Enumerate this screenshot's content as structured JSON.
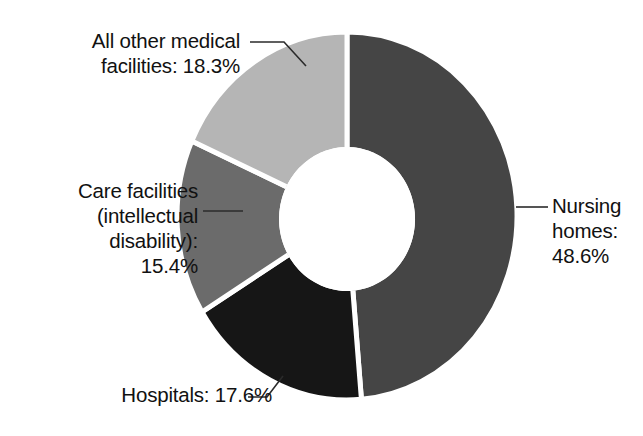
{
  "chart_data": {
    "type": "pie",
    "variant": "donut",
    "title": "",
    "subtitle": "",
    "xlabel": "",
    "ylabel": "",
    "legend_position": "none",
    "grid": false,
    "units": "percent",
    "total": 99.9,
    "start_angle_deg": 0,
    "direction": "clockwise",
    "inner_radius_ratio": 0.39,
    "categories": [
      "Nursing homes",
      "Hospitals",
      "Care facilities (intellectual disability)",
      "All other medical facilities"
    ],
    "values": [
      48.6,
      17.6,
      15.4,
      18.3
    ],
    "value_labels": [
      "48.6%",
      "17.6%",
      "15.4%",
      "18.3%"
    ],
    "colors": [
      "#454545",
      "#161616",
      "#6b6b6b",
      "#b5b5b5"
    ],
    "slices": [
      {
        "name": "Nursing homes",
        "value": 48.6,
        "value_label": "48.6%",
        "color": "#454545",
        "label_text": "Nursing\nhomes:\n48.6%",
        "label_position": "right"
      },
      {
        "name": "Hospitals",
        "value": 17.6,
        "value_label": "17.6%",
        "color": "#161616",
        "label_text": "Hospitals: 17.6%",
        "label_position": "bottom-left"
      },
      {
        "name": "Care facilities (intellectual disability)",
        "value": 15.4,
        "value_label": "15.4%",
        "color": "#6b6b6b",
        "label_text": "Care facilities\n(intellectual\ndisability):\n15.4%",
        "label_position": "left"
      },
      {
        "name": "All other medical facilities",
        "value": 18.3,
        "value_label": "18.3%",
        "color": "#b5b5b5",
        "label_text": "All other medical\nfacilities: 18.3%",
        "label_position": "top-left"
      }
    ]
  },
  "labels": {
    "all_other_medical": "All other medical\nfacilities: 18.3%",
    "care_facilities": "Care facilities\n(intellectual\ndisability):\n15.4%",
    "hospitals": "Hospitals: 17.6%",
    "nursing_homes": "Nursing\nhomes:\n48.6%"
  },
  "colors": {
    "background": "#ffffff",
    "text": "#111111",
    "leader_line": "#2b2b2b",
    "slice_gap": "#ffffff",
    "nursing_homes": "#454545",
    "hospitals": "#161616",
    "care_facilities": "#6b6b6b",
    "all_other_medical": "#b5b5b5"
  }
}
